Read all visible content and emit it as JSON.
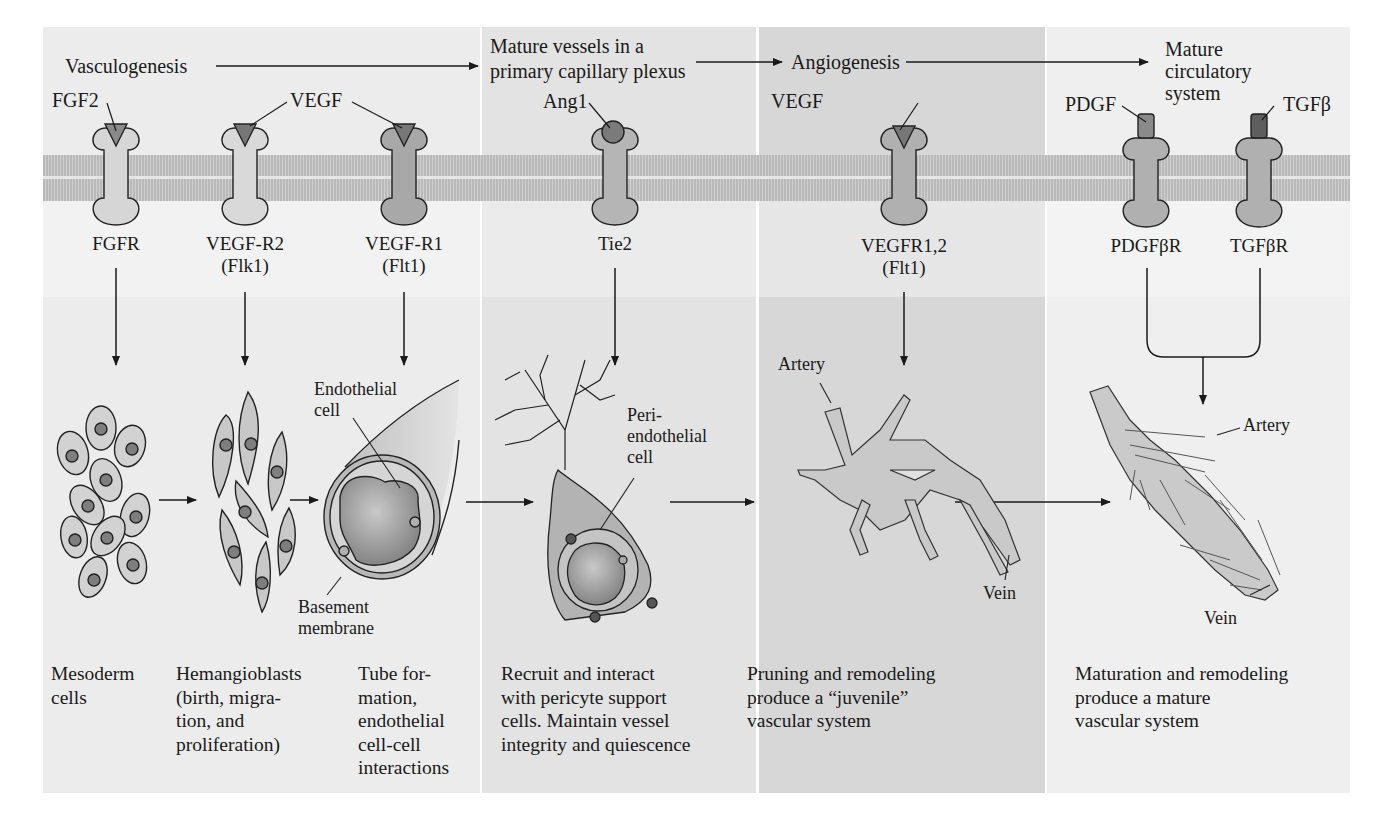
{
  "colors": {
    "panel_1": "#ececec",
    "panel_2": "#e2e2e2",
    "panel_3": "#d6d6d6",
    "panel_4": "#efefef",
    "membrane": "#bdbdbd",
    "receptor_light": "#d4d4d4",
    "receptor_dark": "#a9a9a9",
    "ligand": "#7a7a7a",
    "ink": "#1a1a1a"
  },
  "stages": {
    "vasculogenesis": "Vasculogenesis",
    "mature_vessels": "Mature vessels in a\nprimary capillary plexus",
    "angiogenesis": "Angiogenesis",
    "mature_system": "Mature\ncirculatory\nsystem"
  },
  "ligands": {
    "fgf2": "FGF2",
    "vegf_1": "VEGF",
    "ang1": "Ang1",
    "vegf_2": "VEGF",
    "pdgf": "PDGF",
    "tgfb": "TGFβ"
  },
  "receptors": [
    {
      "name": "FGFR",
      "alt": ""
    },
    {
      "name": "VEGF-R2",
      "alt": "(Flk1)"
    },
    {
      "name": "VEGF-R1",
      "alt": "(Flt1)"
    },
    {
      "name": "Tie2",
      "alt": ""
    },
    {
      "name": "VEGFR1,2",
      "alt": "(Flt1)"
    },
    {
      "name": "PDGFβR",
      "alt": ""
    },
    {
      "name": "TGFβR",
      "alt": ""
    }
  ],
  "illustration_labels": {
    "endothelial_cell": "Endothelial\ncell",
    "basement_membrane": "Basement\nmembrane",
    "peri_endothelial_cell": "Peri-\nendothelial\ncell",
    "artery_1": "Artery",
    "vein_1": "Vein",
    "artery_2": "Artery",
    "vein_2": "Vein"
  },
  "captions": [
    "Mesoderm\ncells",
    "Hemangioblasts\n(birth, migra-\ntion, and\nproliferation)",
    "Tube for-\nmation,\nendothelial\ncell-cell\ninteractions",
    "Recruit and interact\nwith pericyte support\ncells.  Maintain vessel\nintegrity and quiescence",
    "Pruning and remodeling\nproduce a “juvenile”\nvascular system",
    "Maturation and remodeling\nproduce a mature\nvascular system"
  ]
}
